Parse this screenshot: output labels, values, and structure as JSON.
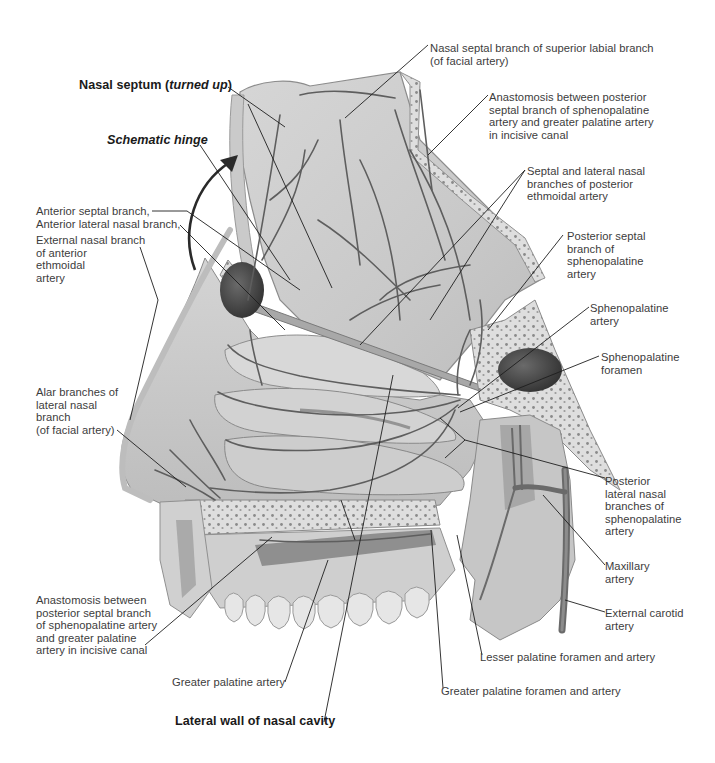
{
  "figure": {
    "colors": {
      "background": "#ffffff",
      "tissue_light": "#dcdcdc",
      "tissue_mid": "#b9b9b9",
      "tissue_dark": "#8c8c8c",
      "vessel": "#5e5e5e",
      "sinus_dark": "#4a4a4a",
      "leader_line": "#1e1e1e",
      "label_text": "#3c3c3c",
      "title_text": "#1a1a1a"
    }
  },
  "titles": {
    "nasal_septum_prefix": "Nasal septum (",
    "nasal_septum_italic": "turned up",
    "nasal_septum_suffix": ")",
    "schematic_hinge": "Schematic hinge",
    "lateral_wall": "Lateral wall of nasal cavity"
  },
  "labels": {
    "left": [
      {
        "id": "anterior-septal-branch",
        "text": "Anterior septal branch,"
      },
      {
        "id": "anterior-lateral-nasal-branch",
        "text": "Anterior lateral nasal branch,"
      },
      {
        "id": "external-nasal-branch",
        "text": "External nasal branch\nof anterior\nethmoidal\nartery"
      },
      {
        "id": "alar-branches",
        "text": "Alar branches of\nlateral nasal\nbranch\n(of facial artery)"
      },
      {
        "id": "anastomosis-left",
        "text": "Anastomosis between\nposterior septal branch\nof sphenopalatine artery\nand greater palatine\nartery in incisive canal"
      }
    ],
    "right": [
      {
        "id": "nasal-septal-branch-superior-labial",
        "text": "Nasal septal branch of superior labial branch\n(of facial artery)"
      },
      {
        "id": "anastomosis-right",
        "text": "Anastomosis between posterior\nseptal branch of sphenopalatine\nartery and greater palatine artery\nin incisive canal"
      },
      {
        "id": "septal-lateral-nasal-posterior-ethmoidal",
        "text": "Septal and lateral nasal\nbranches of posterior\nethmoidal artery"
      },
      {
        "id": "posterior-septal-branch",
        "text": "Posterior septal\nbranch of\nsphenopalatine\nartery"
      },
      {
        "id": "sphenopalatine-artery",
        "text": "Sphenopalatine\nartery"
      },
      {
        "id": "sphenopalatine-foramen",
        "text": "Sphenopalatine\nforamen"
      },
      {
        "id": "posterior-lateral-nasal-branches",
        "text": "Posterior\nlateral nasal\nbranches of\nsphenopalatine\nartery"
      },
      {
        "id": "maxillary-artery",
        "text": "Maxillary\nartery"
      },
      {
        "id": "external-carotid-artery",
        "text": "External carotid\nartery"
      }
    ],
    "bottom": [
      {
        "id": "greater-palatine-artery",
        "text": "Greater palatine artery"
      },
      {
        "id": "lesser-palatine-foramen",
        "text": "Lesser palatine foramen and artery"
      },
      {
        "id": "greater-palatine-foramen",
        "text": "Greater palatine foramen and artery"
      }
    ]
  }
}
